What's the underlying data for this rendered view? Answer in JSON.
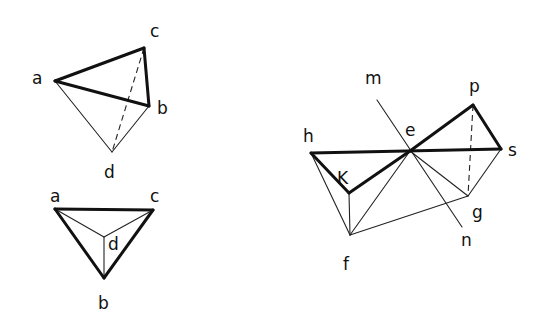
{
  "figures": [
    {
      "name": "tetrahedron-top-left",
      "points": {
        "a": [
          55,
          81
        ],
        "c": [
          144,
          48
        ],
        "b": [
          149,
          106
        ],
        "d": [
          112,
          152
        ]
      },
      "labels": [
        {
          "text": "a",
          "x": 32,
          "y": 84
        },
        {
          "text": "c",
          "x": 150,
          "y": 37
        },
        {
          "text": "b",
          "x": 157,
          "y": 114
        },
        {
          "text": "d",
          "x": 104,
          "y": 178
        }
      ],
      "edges": [
        {
          "from": "a",
          "to": "c",
          "style": "thick"
        },
        {
          "from": "a",
          "to": "b",
          "style": "thick"
        },
        {
          "from": "c",
          "to": "b",
          "style": "thick"
        },
        {
          "from": "a",
          "to": "d",
          "style": "thin"
        },
        {
          "from": "d",
          "to": "b",
          "style": "thin"
        },
        {
          "from": "c",
          "to": "d",
          "style": "dash"
        }
      ]
    },
    {
      "name": "tetrahedron-bottom-left",
      "points": {
        "a": [
          55,
          209
        ],
        "c": [
          153,
          210
        ],
        "d": [
          104,
          237
        ],
        "b": [
          104,
          278
        ]
      },
      "labels": [
        {
          "text": "a",
          "x": 50,
          "y": 202
        },
        {
          "text": "c",
          "x": 150,
          "y": 202
        },
        {
          "text": "d",
          "x": 108,
          "y": 250
        },
        {
          "text": "b",
          "x": 98,
          "y": 309
        }
      ],
      "edges": [
        {
          "from": "a",
          "to": "c",
          "style": "thick"
        },
        {
          "from": "a",
          "to": "b",
          "style": "thick"
        },
        {
          "from": "c",
          "to": "b",
          "style": "thick"
        },
        {
          "from": "a",
          "to": "d",
          "style": "thin"
        },
        {
          "from": "c",
          "to": "d",
          "style": "thin"
        },
        {
          "from": "d",
          "to": "b",
          "style": "thin"
        }
      ]
    },
    {
      "name": "double-tetrahedron-right",
      "points": {
        "h": [
          311,
          153
        ],
        "e": [
          410,
          151
        ],
        "s": [
          501,
          149
        ],
        "p": [
          473,
          105
        ],
        "K": [
          349,
          193
        ],
        "g": [
          468,
          196
        ],
        "f": [
          350,
          235
        ],
        "m": [
          377,
          100
        ],
        "n": [
          462,
          227
        ]
      },
      "labels": [
        {
          "text": "m",
          "x": 365,
          "y": 84
        },
        {
          "text": "p",
          "x": 469,
          "y": 92
        },
        {
          "text": "h",
          "x": 303,
          "y": 142
        },
        {
          "text": "e",
          "x": 405,
          "y": 136
        },
        {
          "text": "s",
          "x": 508,
          "y": 156
        },
        {
          "text": "K",
          "x": 337,
          "y": 184
        },
        {
          "text": "g",
          "x": 472,
          "y": 218
        },
        {
          "text": "n",
          "x": 461,
          "y": 246
        },
        {
          "text": "f",
          "x": 343,
          "y": 270
        }
      ],
      "edges": [
        {
          "from": "h",
          "to": "s",
          "style": "thick"
        },
        {
          "from": "h",
          "to": "K",
          "style": "thick"
        },
        {
          "from": "K",
          "to": "e",
          "style": "thick"
        },
        {
          "from": "e",
          "to": "p",
          "style": "thick"
        },
        {
          "from": "p",
          "to": "s",
          "style": "thick"
        },
        {
          "from": "h",
          "to": "f",
          "style": "thin"
        },
        {
          "from": "K",
          "to": "f",
          "style": "thin"
        },
        {
          "from": "f",
          "to": "e",
          "style": "thin"
        },
        {
          "from": "f",
          "to": "g",
          "style": "thin"
        },
        {
          "from": "e",
          "to": "g",
          "style": "thin"
        },
        {
          "from": "g",
          "to": "s",
          "style": "thin"
        },
        {
          "from": "m",
          "to": "n",
          "style": "thin"
        },
        {
          "from": "p",
          "to": "g",
          "style": "dash"
        }
      ]
    }
  ]
}
